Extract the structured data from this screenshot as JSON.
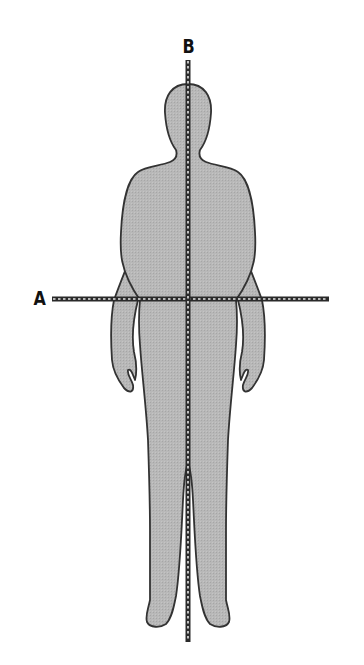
{
  "diagram": {
    "type": "anatomical-planes",
    "colors": {
      "body_fill": "#b4b4b4",
      "body_stroke": "#333333",
      "line_dark": "#2a2a2a",
      "line_dash": "#e6e6e6"
    },
    "axes": [
      {
        "id": "A",
        "label": "A",
        "orientation": "horizontal",
        "x1": 52,
        "x2": 329,
        "y": 299
      },
      {
        "id": "B",
        "label": "B",
        "orientation": "vertical",
        "x": 188,
        "y1": 60,
        "y2": 642
      }
    ]
  }
}
